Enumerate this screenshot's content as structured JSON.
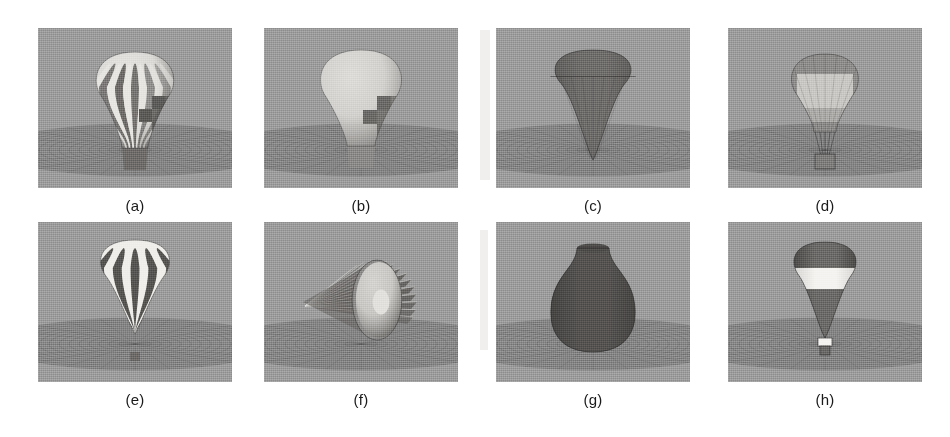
{
  "figure": {
    "caption_style": "alphabetic-parenthesized",
    "background_color": "#ffffff",
    "scene_background_color": "#9c9c9c",
    "ground_plane_color": "#8a8a8a",
    "columns": 4,
    "rows": 2,
    "panel_width": 194,
    "panel_height": 160
  },
  "panels": [
    {
      "id": "a",
      "label": "(a)",
      "subject": "striped-hot-air-balloon-on-ground",
      "shape": "balloon-wide-gores",
      "x": 38,
      "y": 28,
      "stripe_count": 11,
      "has_basket": true,
      "has_checker_patch": true,
      "floating": false,
      "body_light_color": "#e8e6e2",
      "body_dark_color": "#6e6c6a",
      "patch_color": "#5a5957"
    },
    {
      "id": "b",
      "label": "(b)",
      "subject": "smooth-shaded-balloon-with-checker-patch",
      "shape": "balloon-smooth",
      "x": 264,
      "y": 28,
      "stripe_count": 0,
      "has_basket": true,
      "has_checker_patch": true,
      "floating": false,
      "body_light_color": "#dedcd8",
      "body_dark_color": "#8b8987",
      "patch_color": "#6a6866"
    },
    {
      "id": "c",
      "label": "(c)",
      "subject": "dark-faceted-teardrop-cone",
      "shape": "teardrop-cone",
      "x": 496,
      "y": 28,
      "stripe_count": 0,
      "has_basket": false,
      "has_checker_patch": false,
      "floating": true,
      "body_light_color": "#6f6d6b",
      "body_dark_color": "#565452",
      "patch_color": "#4d4b49"
    },
    {
      "id": "d",
      "label": "(d)",
      "subject": "faceted-balloon-with-square-basket",
      "shape": "balloon-faceted",
      "x": 728,
      "y": 28,
      "stripe_count": 0,
      "has_basket": true,
      "has_checker_patch": true,
      "floating": true,
      "body_light_color": "#c9c7c3",
      "body_dark_color": "#8e8c8a",
      "patch_color": "#b5b3af"
    },
    {
      "id": "e",
      "label": "(e)",
      "subject": "high-contrast-striped-balloon-airborne",
      "shape": "balloon-teardrop-gores",
      "x": 38,
      "y": 222,
      "stripe_count": 9,
      "has_basket": true,
      "has_checker_patch": false,
      "floating": true,
      "body_light_color": "#efeeea",
      "body_dark_color": "#575553",
      "patch_color": "#6a6866"
    },
    {
      "id": "f",
      "label": "(f)",
      "subject": "bevel-gear-with-central-bore",
      "shape": "bevel-gear",
      "x": 264,
      "y": 222,
      "stripe_count": 18,
      "has_basket": false,
      "has_checker_patch": false,
      "floating": false,
      "body_light_color": "#e2e0dc",
      "body_dark_color": "#676563",
      "patch_color": "#8d8b89"
    },
    {
      "id": "g",
      "label": "(g)",
      "subject": "dark-ceramic-vase-surface-of-revolution",
      "shape": "vase",
      "x": 496,
      "y": 222,
      "stripe_count": 0,
      "has_basket": false,
      "has_checker_patch": false,
      "floating": false,
      "body_light_color": "#6a6866",
      "body_dark_color": "#474543",
      "patch_color": "#4f4d4b"
    },
    {
      "id": "h",
      "label": "(h)",
      "subject": "dark-balloon-with-white-band-and-basket",
      "shape": "balloon-teardrop",
      "x": 728,
      "y": 222,
      "stripe_count": 0,
      "has_basket": true,
      "has_checker_patch": false,
      "floating": false,
      "body_light_color": "#f4f3f0",
      "body_dark_color": "#4e4c4a",
      "patch_color": "#6b6967"
    }
  ]
}
